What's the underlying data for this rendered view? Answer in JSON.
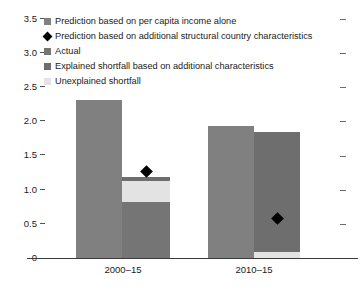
{
  "chart_data": {
    "type": "bar",
    "title": "",
    "subtitle": "",
    "xlabel": "",
    "ylabel": "",
    "ylim": [
      0,
      3.5
    ],
    "ytick_values": [
      0,
      0.5,
      1.0,
      1.5,
      2.0,
      2.5,
      3.0,
      3.5
    ],
    "ytick_labels": [
      "0",
      "0.5",
      "1.0",
      "1.5",
      "2.0",
      "2.5",
      "3.0",
      "3.5"
    ],
    "grid": false,
    "legend_position": "top-left-inside",
    "categories": [
      "2000–15",
      "2010–15"
    ],
    "series": [
      {
        "name": "Prediction based on per capita income alone",
        "color": "#808080",
        "values": [
          2.32,
          1.93
        ]
      },
      {
        "name": "Explained shortfall based on additional characteristics",
        "color": "#6e6e6e",
        "values": [
          1.19,
          1.84
        ]
      },
      {
        "name": "Unexplained shortfall",
        "color": "#e3e3e3",
        "values": [
          0.31,
          0.09
        ]
      },
      {
        "name": "Actual",
        "color": "#757575",
        "values": [
          0.82,
          0.0
        ]
      }
    ],
    "markers": {
      "name": "Prediction based on additional structural country characteristics",
      "color": "#000000",
      "shape": "diamond",
      "values": [
        1.26,
        0.58
      ]
    },
    "annotations": []
  },
  "legend": {
    "items": [
      {
        "label": "Prediction based on per capita income alone",
        "swatch": "square",
        "color": "#808080"
      },
      {
        "label": "Prediction based on additional structural country characteristics",
        "swatch": "diamond",
        "color": "#000000"
      },
      {
        "label": "Actual",
        "swatch": "square",
        "color": "#757575"
      },
      {
        "label": "Explained shortfall based on additional characteristics",
        "swatch": "square",
        "color": "#6e6e6e"
      },
      {
        "label": "Unexplained shortfall",
        "swatch": "square",
        "color": "#e3e3e3"
      }
    ]
  },
  "axes": {
    "y_ticks": [
      "3.5",
      "3.0",
      "2.5",
      "2.0",
      "1.5",
      "1.0",
      "0.5",
      "0"
    ],
    "x_categories": [
      "2000–15",
      "2010–15"
    ]
  }
}
